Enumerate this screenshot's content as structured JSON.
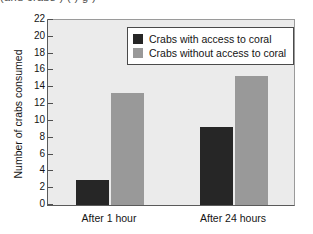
{
  "clipped_header_text": "(and crabs ) ( ) g )",
  "chart_data": {
    "type": "bar",
    "title": "",
    "xlabel": "",
    "ylabel": "Number of crabs consumed",
    "categories": [
      "After 1 hour",
      "After 24 hours"
    ],
    "series": [
      {
        "name": "Crabs with access to coral",
        "color": "#262626",
        "values": [
          3,
          9.3
        ]
      },
      {
        "name": "Crabs without access to coral",
        "color": "#999999",
        "values": [
          13.3,
          15.3
        ]
      }
    ],
    "ylim": [
      0,
      22
    ],
    "ytick_step": 2,
    "yticks": [
      0,
      2,
      4,
      6,
      8,
      10,
      12,
      14,
      16,
      18,
      20,
      22
    ],
    "grid": false,
    "legend_position": "top-right-inside",
    "plot_background": "#ebebeb",
    "figure_background": "#ffffff"
  }
}
